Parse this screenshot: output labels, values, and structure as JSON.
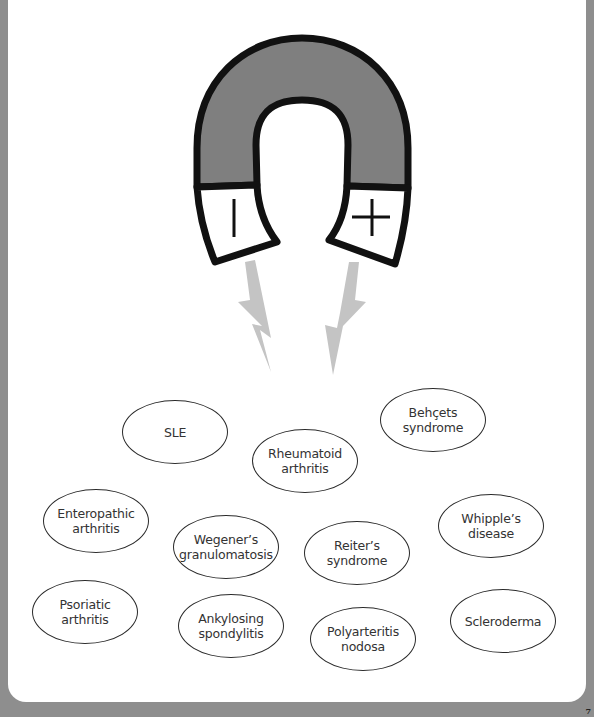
{
  "figure": {
    "title": "",
    "magnet": {
      "negative_pole_symbol": "|",
      "positive_pole_symbol": "+",
      "body_color": "#7f7f7f",
      "outline_color": "#111111"
    },
    "lightning_color": "#c4c4c4",
    "diseases": [
      {
        "id": "sle",
        "label": "SLE"
      },
      {
        "id": "rheumatoid-arthritis",
        "label": "Rheumatoid\narthritis"
      },
      {
        "id": "behcets-syndrome",
        "label": "Behçets\nsyndrome"
      },
      {
        "id": "enteropathic-arthritis",
        "label": "Enteropathic\narthritis"
      },
      {
        "id": "wegeners-granulomatosis",
        "label": "Wegener’s\ngranulomatosis"
      },
      {
        "id": "reiters-syndrome",
        "label": "Reiter’s\nsyndrome"
      },
      {
        "id": "whipples-disease",
        "label": "Whipple’s\ndisease"
      },
      {
        "id": "psoriatic-arthritis",
        "label": "Psoriatic\narthritis"
      },
      {
        "id": "ankylosing-spondylitis",
        "label": "Ankylosing\nspondylitis"
      },
      {
        "id": "polyarteritis-nodosa",
        "label": "Polyarteritis\nnodosa"
      },
      {
        "id": "scleroderma",
        "label": "Scleroderma"
      }
    ]
  },
  "page_number": "7"
}
